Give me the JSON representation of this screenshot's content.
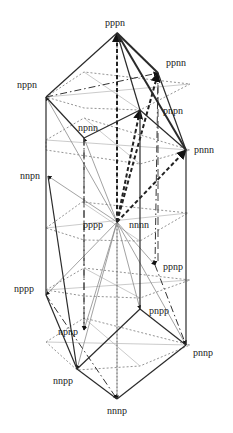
{
  "diagram": {
    "type": "lattice-prism",
    "colors": {
      "solid": "#2a2a2a",
      "dotted": "#777777",
      "light": "#b5b5b5",
      "arrow": "#111111"
    },
    "nodes": [
      {
        "id": "pppn",
        "label": "pppn",
        "x": 117,
        "y": 33,
        "lx": 105,
        "ly": 26
      },
      {
        "id": "ppnn",
        "label": "ppnn",
        "x": 158,
        "y": 73,
        "lx": 166,
        "ly": 66
      },
      {
        "id": "nppn",
        "label": "nppn",
        "x": 46,
        "y": 97,
        "lx": 17,
        "ly": 88
      },
      {
        "id": "pnpn",
        "label": "pnpn",
        "x": 140,
        "y": 110,
        "lx": 163,
        "ly": 114
      },
      {
        "id": "pnnn",
        "label": "pnnn",
        "x": 186,
        "y": 150,
        "lx": 194,
        "ly": 153
      },
      {
        "id": "npnn",
        "label": "npnn",
        "x": 84,
        "y": 138,
        "lx": 78,
        "ly": 131
      },
      {
        "id": "nnpn",
        "label": "nnpn",
        "x": 48,
        "y": 176,
        "lx": 20,
        "ly": 179
      },
      {
        "id": "pppp",
        "label": "pppp",
        "x": 117,
        "y": 222,
        "lx": 83,
        "ly": 228
      },
      {
        "id": "nnnn",
        "label": "nnnn",
        "x": 117,
        "y": 222,
        "lx": 129,
        "ly": 228
      },
      {
        "id": "ppnp",
        "label": "ppnp",
        "x": 155,
        "y": 265,
        "lx": 163,
        "ly": 270
      },
      {
        "id": "nppp",
        "label": "nppp",
        "x": 46,
        "y": 295,
        "lx": 14,
        "ly": 292
      },
      {
        "id": "pnpp",
        "label": "pnpp",
        "x": 140,
        "y": 309,
        "lx": 149,
        "ly": 314
      },
      {
        "id": "npnp",
        "label": "npnp",
        "x": 84,
        "y": 330,
        "lx": 58,
        "ly": 335
      },
      {
        "id": "pnnp",
        "label": "pnnp",
        "x": 186,
        "y": 345,
        "lx": 193,
        "ly": 356
      },
      {
        "id": "nnpp",
        "label": "nnpp",
        "x": 77,
        "y": 369,
        "lx": 53,
        "ly": 384
      },
      {
        "id": "nnnp",
        "label": "nnnp",
        "x": 117,
        "y": 399,
        "lx": 107,
        "ly": 414
      }
    ],
    "solid_edges": [
      [
        "pppn",
        "nppn"
      ],
      [
        "pppn",
        "ppnn"
      ],
      [
        "pppn",
        "pnnn"
      ],
      [
        "ppnn",
        "pnnn"
      ],
      [
        "pppn",
        "pnpn"
      ],
      [
        "nppn",
        "nppp"
      ],
      [
        "pnnn",
        "pnnp"
      ],
      [
        "pnpn",
        "pnpp"
      ],
      [
        "nppn",
        "npnn"
      ],
      [
        "npnn",
        "pnpn"
      ],
      [
        "nppp",
        "nnpp"
      ],
      [
        "nnpp",
        "nnnp"
      ],
      [
        "nnnp",
        "pnnp"
      ],
      [
        "nnpp",
        "pnpp"
      ],
      [
        "pnpp",
        "pnnp"
      ],
      [
        "nnpn",
        "nnpp"
      ],
      [
        "pnpn",
        "pnnn"
      ]
    ],
    "thick_dashed_edges": [
      [
        "pppp",
        "pppn"
      ],
      [
        "pppp",
        "ppnn"
      ],
      [
        "pppp",
        "pnnn"
      ],
      [
        "pppp",
        "pnpn"
      ]
    ],
    "center_fan": [
      "nppn",
      "npnn",
      "nnpn",
      "ppnp",
      "nppp",
      "pnpp",
      "npnp",
      "pnnp",
      "nnpp",
      "nnnp"
    ],
    "dashdot_edges": [
      [
        "nppn",
        "ppnn"
      ],
      [
        "nppp",
        "nnnp"
      ],
      [
        "npnn",
        "npnp"
      ],
      [
        "ppnn",
        "ppnp"
      ],
      [
        "ppnp",
        "pnnp"
      ]
    ],
    "layers": [
      [
        [
          46,
          97
        ],
        [
          84,
          72
        ],
        [
          190,
          84
        ],
        [
          140,
          110
        ],
        [
          84,
          108
        ]
      ],
      [
        [
          46,
          140
        ],
        [
          84,
          118
        ],
        [
          190,
          150
        ],
        [
          140,
          164
        ],
        [
          46,
          150
        ]
      ],
      [
        [
          46,
          228
        ],
        [
          82,
          202
        ],
        [
          188,
          213
        ],
        [
          140,
          241
        ],
        [
          84,
          240
        ]
      ],
      [
        [
          46,
          290
        ],
        [
          84,
          268
        ],
        [
          190,
          280
        ],
        [
          140,
          298
        ],
        [
          84,
          296
        ]
      ],
      [
        [
          46,
          342
        ],
        [
          84,
          318
        ],
        [
          190,
          345
        ],
        [
          140,
          366
        ],
        [
          77,
          370
        ]
      ]
    ]
  }
}
